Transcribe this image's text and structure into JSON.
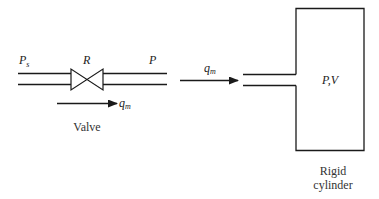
{
  "diagram": {
    "valve_section": {
      "upstream_pressure": {
        "main": "P",
        "sub": "s"
      },
      "resistance_label": "R",
      "downstream_pressure": "P",
      "flow": {
        "main": "q",
        "sub": "m"
      },
      "caption": "Valve"
    },
    "cylinder_section": {
      "flow": {
        "main": "q",
        "sub": "m"
      },
      "state_label": "P,V",
      "caption_line1": "Rigid",
      "caption_line2": "cylinder"
    },
    "colors": {
      "stroke": "#1a1a1a",
      "background": "#ffffff"
    }
  }
}
